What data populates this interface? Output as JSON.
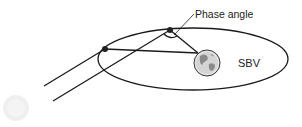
{
  "diagram": {
    "labels": {
      "phase_angle": "Phase angle",
      "planet": "SBV"
    },
    "elements": {
      "orbit": "elliptical orbit",
      "sun": "sun (light source)",
      "planet": "Earth globe",
      "spacecraft": [
        "observer position 1",
        "observer position 2"
      ]
    },
    "colors": {
      "line": "#1a1a1a",
      "globe_fill": "#d8d8d8",
      "sun": "#eeeeee"
    }
  }
}
